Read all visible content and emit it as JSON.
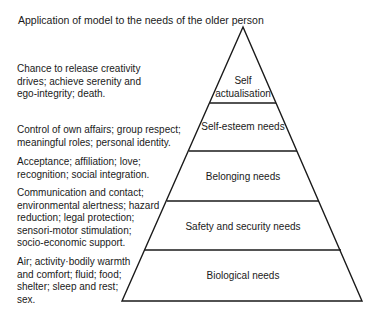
{
  "title": "Application of model to the needs of the older person",
  "pyramid": {
    "apex": [
      243,
      27
    ],
    "base_left": [
      122,
      301
    ],
    "base_right": [
      362,
      301
    ],
    "stroke_color": "#1a1a1a",
    "levels": [
      {
        "label": "Self\nactualisation",
        "description": "Chance to release creativity\ndrives; achieve serenity and\nego-integrity; death."
      },
      {
        "label": "Self-esteem needs",
        "description": "Control of own affairs; group respect;\nmeaningful roles; personal identity."
      },
      {
        "label": "Belonging needs",
        "description": "Acceptance; affiliation; love;\nrecognition; social integration."
      },
      {
        "label": "Safety and security needs",
        "description": "Communication and contact;\nenvironmental alertness; hazard\nreduction; legal protection;\nsensori-motor stimulation;\nsocio-economic support."
      },
      {
        "label": "Biological needs",
        "description": "Air; activity·bodily warmth\nand comfort; fluid; food;\nshelter; sleep and rest;\nsex."
      }
    ]
  }
}
